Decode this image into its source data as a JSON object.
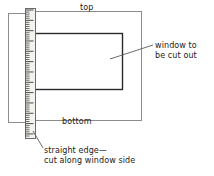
{
  "figure": {
    "labels": {
      "top": "top",
      "bottom": "bottom",
      "window": "window to\nbe cut out",
      "straight_edge": "straight edge—\ncut along window side"
    },
    "colors": {
      "background": "#ffffff",
      "ink": "#1a1a1a",
      "sheet_outline": "#8c8c8c",
      "ruler_outline": "#6b6b6b",
      "ruler_body": "#f2f0ec",
      "tick": "#4a4a4a",
      "leader": "#5a5a5a"
    },
    "parts": [
      {
        "name": "backing-sheet",
        "shape": "rectangle",
        "x": 8,
        "y": 13,
        "width": 26,
        "height": 109
      },
      {
        "name": "front-sheet",
        "shape": "rectangle",
        "x": 33,
        "y": 11,
        "width": 108,
        "height": 109
      },
      {
        "name": "window-cutout",
        "shape": "rectangle",
        "x": 33,
        "y": 33,
        "width": 89,
        "height": 56
      },
      {
        "name": "straight-edge-ruler",
        "shape": "rectangle",
        "x": 25,
        "y": 8,
        "width": 10,
        "height": 130
      }
    ],
    "ruler": {
      "name": "straight-edge",
      "orientation": "vertical",
      "tick_count": 62,
      "major_tick_every": 5,
      "minor_tick_length": 4,
      "major_tick_length": 8
    },
    "leaders": [
      {
        "name": "window-leader",
        "from_x": 153,
        "from_y": 45,
        "to_x": 110,
        "to_y": 59
      },
      {
        "name": "straight-edge-leader",
        "from_x": 43,
        "from_y": 148,
        "to_x": 33,
        "to_y": 131
      }
    ]
  }
}
